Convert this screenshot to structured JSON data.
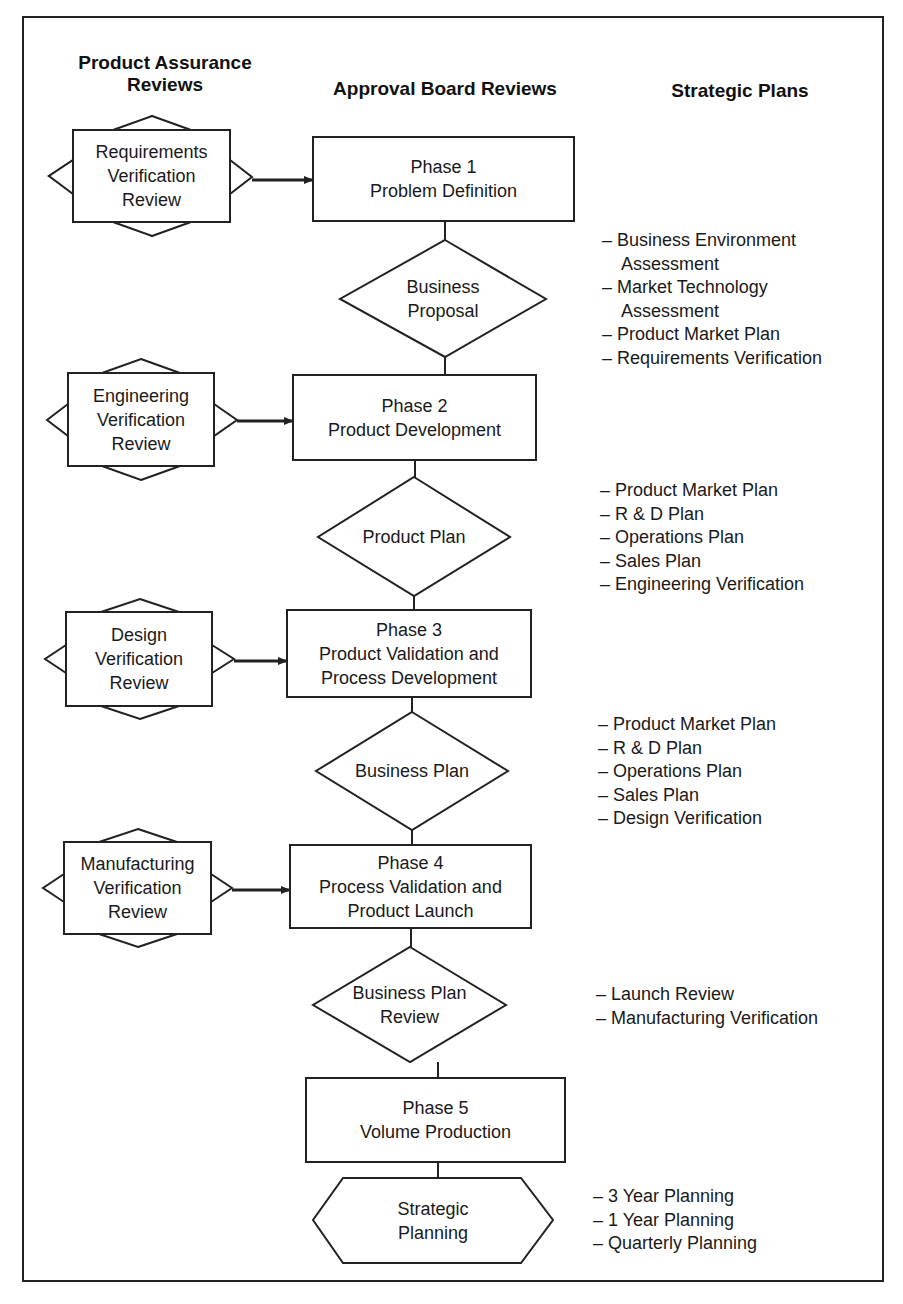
{
  "headers": {
    "product_assurance_line1": "Product Assurance",
    "product_assurance_line2": "Reviews",
    "approval_board": "Approval Board Reviews",
    "strategic_plans": "Strategic Plans"
  },
  "reviews": [
    {
      "lines": [
        "Requirements",
        "Verification",
        "Review"
      ]
    },
    {
      "lines": [
        "Engineering",
        "Verification",
        "Review"
      ]
    },
    {
      "lines": [
        "Design",
        "Verification",
        "Review"
      ]
    },
    {
      "lines": [
        "Manufacturing",
        "Verification",
        "Review"
      ]
    }
  ],
  "phases": [
    {
      "lines": [
        "Phase 1",
        "Problem Definition"
      ]
    },
    {
      "lines": [
        "Phase 2",
        "Product Development"
      ]
    },
    {
      "lines": [
        "Phase 3",
        "Product Validation and",
        "Process Development"
      ]
    },
    {
      "lines": [
        "Phase 4",
        "Process Validation and",
        "Product Launch"
      ]
    },
    {
      "lines": [
        "Phase 5",
        "Volume Production"
      ]
    }
  ],
  "decisions": [
    {
      "lines": [
        "Business",
        "Proposal"
      ]
    },
    {
      "lines": [
        "Product Plan"
      ]
    },
    {
      "lines": [
        "Business Plan"
      ]
    },
    {
      "lines": [
        "Business Plan",
        "Review"
      ]
    }
  ],
  "terminal": {
    "lines": [
      "Strategic",
      "Planning"
    ]
  },
  "plans": [
    {
      "items": [
        "– Business Environment",
        "Assessment",
        "– Market Technology",
        "Assessment",
        "– Product Market Plan",
        "– Requirements Verification"
      ]
    },
    {
      "items": [
        "– Product Market Plan",
        "– R & D Plan",
        "– Operations Plan",
        "– Sales Plan",
        "– Engineering Verification"
      ]
    },
    {
      "items": [
        "– Product Market Plan",
        "– R & D Plan",
        "– Operations Plan",
        "– Sales Plan",
        "– Design Verification"
      ]
    },
    {
      "items": [
        "– Launch Review",
        "– Manufacturing Verification"
      ]
    },
    {
      "items": [
        "– 3 Year Planning",
        "– 1 Year Planning",
        "– Quarterly Planning"
      ]
    }
  ],
  "colors": {
    "stroke": "#222222",
    "background": "#ffffff",
    "text": "#1a1a1a"
  }
}
